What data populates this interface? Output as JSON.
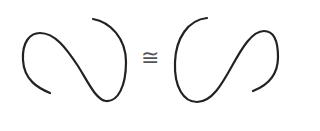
{
  "diagram": {
    "left_curve": {
      "label": "left-knot-curve",
      "color": "#222222"
    },
    "relation_symbol": "≅",
    "right_curve": {
      "label": "right-knot-curve",
      "color": "#222222"
    },
    "symbol_color": "#555555"
  }
}
